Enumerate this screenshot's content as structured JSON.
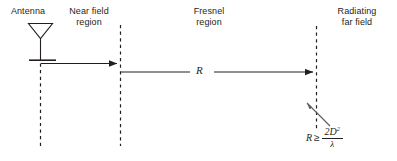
{
  "diagram": {
    "background_color": "#ffffff",
    "ink_color": "#231f20",
    "labels": {
      "antenna": "Antenna",
      "near_field": "Near field\nregion",
      "fresnel": "Fresnel\nregion",
      "far_field": "Radiating\nfar field"
    },
    "distance_symbol": "R",
    "formula": {
      "lhs": "R",
      "relation": "≥",
      "numerator": "2D",
      "numerator_exponent": "2",
      "denominator": "λ"
    },
    "elements": {
      "antenna_icon": "antenna-triangle-icon",
      "boundary_1": "near-field-boundary",
      "boundary_2": "fresnel-boundary",
      "boundary_3": "far-field-boundary",
      "arrow_near_field": "near-field-extent-arrow",
      "arrow_distance": "distance-R-arrow",
      "leader": "formula-leader-arrow"
    }
  }
}
